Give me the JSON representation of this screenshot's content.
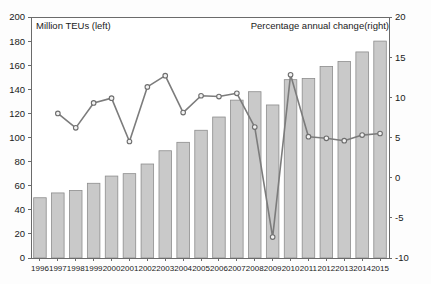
{
  "chart_data": {
    "type": "bar",
    "title": "",
    "subtitle": "",
    "xlabel": "",
    "ylabel": "",
    "grid": false,
    "legend_position": "inside-top",
    "left_axis": {
      "label": "Million TEUs (left)",
      "ylim": [
        0,
        200
      ],
      "ticks": [
        0,
        20,
        40,
        60,
        80,
        100,
        120,
        140,
        160,
        180,
        200
      ],
      "tick_labels": [
        "0",
        "20",
        "40",
        "60",
        "80",
        "100",
        "120",
        "140",
        "160",
        "180",
        "200"
      ]
    },
    "right_axis": {
      "label": "Percentage annual change(right)",
      "ylim": [
        -10,
        20
      ],
      "ticks": [
        -10,
        -5,
        0,
        5,
        10,
        15,
        20
      ],
      "tick_labels": [
        "-10",
        "-5",
        "0",
        "5",
        "10",
        "15",
        "20"
      ]
    },
    "categories": [
      "1996",
      "1997",
      "1998",
      "1999",
      "2000",
      "2001",
      "2002",
      "2003",
      "2004",
      "2005",
      "2006",
      "2007",
      "2008",
      "2009",
      "2010",
      "2011",
      "2012",
      "2013",
      "2014",
      "2015"
    ],
    "series": [
      {
        "name": "Million TEUs (left)",
        "type": "bar",
        "axis": "left",
        "color": "#c9c9c9",
        "values": [
          50,
          54,
          56,
          62,
          68,
          70,
          78,
          89,
          96,
          106,
          117,
          131,
          138,
          127,
          148,
          149,
          159,
          163,
          171,
          180
        ]
      },
      {
        "name": "Percentage annual change(right)",
        "type": "line",
        "axis": "right",
        "color": "#7c7c7c",
        "values": [
          null,
          8.0,
          6.2,
          9.3,
          9.9,
          4.5,
          11.3,
          12.7,
          8.1,
          10.2,
          10.1,
          10.5,
          6.3,
          -7.4,
          12.8,
          5.1,
          4.9,
          4.6,
          5.3,
          5.5
        ]
      }
    ]
  },
  "notes": {
    "left_note": "Million TEUs (left)",
    "right_note": "Percentage annual change(right)"
  }
}
